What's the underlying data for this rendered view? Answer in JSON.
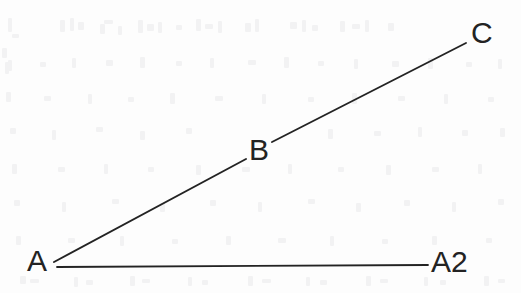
{
  "figure": {
    "background_color": "#fdfdfd",
    "stroke_color": "#232323",
    "labels": {
      "a": "A",
      "b": "B",
      "c": "C",
      "a2": "A2"
    },
    "label_positions": {
      "a": {
        "x": 37,
        "y": 260
      },
      "b": {
        "x": 257,
        "y": 150
      },
      "c": {
        "x": 481,
        "y": 32
      },
      "a2": {
        "x": 457,
        "y": 261
      }
    },
    "segments": [
      {
        "name": "ray-A-to-A2-horizontal",
        "from_label": "A",
        "to_label": "A2",
        "x1": 57,
        "y1": 267,
        "x2": 428,
        "y2": 265,
        "stroke_width": 1.8
      },
      {
        "name": "ray-A-to-B-diagonal",
        "from_label": "A",
        "to_label": "B",
        "x1": 54,
        "y1": 262,
        "x2": 246,
        "y2": 159,
        "stroke_width": 1.9
      },
      {
        "name": "ray-B-to-C-diagonal",
        "from_label": "B",
        "to_label": "C",
        "x1": 272,
        "y1": 142,
        "x2": 466,
        "y2": 43,
        "stroke_width": 1.9
      }
    ],
    "ghost_marks": [
      {
        "x": 8,
        "y": 18,
        "w": 4,
        "h": 14
      },
      {
        "x": 12,
        "y": 34,
        "w": 7,
        "h": 4
      },
      {
        "x": 2,
        "y": 48,
        "w": 5,
        "h": 10
      },
      {
        "x": 5,
        "y": 62,
        "w": 4,
        "h": 12
      },
      {
        "x": 60,
        "y": 20,
        "w": 5,
        "h": 12
      },
      {
        "x": 70,
        "y": 18,
        "w": 4,
        "h": 13
      },
      {
        "x": 78,
        "y": 22,
        "w": 6,
        "h": 8
      },
      {
        "x": 100,
        "y": 24,
        "w": 5,
        "h": 10
      },
      {
        "x": 104,
        "y": 20,
        "w": 9,
        "h": 4
      },
      {
        "x": 118,
        "y": 26,
        "w": 4,
        "h": 9
      },
      {
        "x": 138,
        "y": 20,
        "w": 5,
        "h": 13
      },
      {
        "x": 147,
        "y": 24,
        "w": 7,
        "h": 7
      },
      {
        "x": 158,
        "y": 22,
        "w": 4,
        "h": 11
      },
      {
        "x": 176,
        "y": 25,
        "w": 6,
        "h": 5
      },
      {
        "x": 196,
        "y": 19,
        "w": 5,
        "h": 12
      },
      {
        "x": 205,
        "y": 24,
        "w": 8,
        "h": 5
      },
      {
        "x": 218,
        "y": 21,
        "w": 4,
        "h": 12
      },
      {
        "x": 245,
        "y": 23,
        "w": 6,
        "h": 9
      },
      {
        "x": 255,
        "y": 19,
        "w": 4,
        "h": 13
      },
      {
        "x": 290,
        "y": 22,
        "w": 7,
        "h": 7
      },
      {
        "x": 302,
        "y": 20,
        "w": 4,
        "h": 12
      },
      {
        "x": 312,
        "y": 25,
        "w": 6,
        "h": 6
      },
      {
        "x": 340,
        "y": 21,
        "w": 5,
        "h": 11
      },
      {
        "x": 352,
        "y": 24,
        "w": 8,
        "h": 5
      },
      {
        "x": 365,
        "y": 20,
        "w": 4,
        "h": 12
      },
      {
        "x": 388,
        "y": 23,
        "w": 6,
        "h": 8
      },
      {
        "x": 8,
        "y": 60,
        "w": 4,
        "h": 11
      },
      {
        "x": 40,
        "y": 62,
        "w": 6,
        "h": 5
      },
      {
        "x": 72,
        "y": 58,
        "w": 4,
        "h": 10
      },
      {
        "x": 106,
        "y": 60,
        "w": 7,
        "h": 6
      },
      {
        "x": 140,
        "y": 57,
        "w": 5,
        "h": 11
      },
      {
        "x": 176,
        "y": 61,
        "w": 6,
        "h": 5
      },
      {
        "x": 210,
        "y": 58,
        "w": 4,
        "h": 10
      },
      {
        "x": 248,
        "y": 60,
        "w": 8,
        "h": 5
      },
      {
        "x": 284,
        "y": 57,
        "w": 5,
        "h": 11
      },
      {
        "x": 318,
        "y": 61,
        "w": 6,
        "h": 5
      },
      {
        "x": 354,
        "y": 59,
        "w": 4,
        "h": 10
      },
      {
        "x": 392,
        "y": 61,
        "w": 7,
        "h": 6
      },
      {
        "x": 428,
        "y": 58,
        "w": 5,
        "h": 11
      },
      {
        "x": 466,
        "y": 62,
        "w": 6,
        "h": 5
      },
      {
        "x": 498,
        "y": 59,
        "w": 4,
        "h": 10
      },
      {
        "x": 6,
        "y": 92,
        "w": 5,
        "h": 10
      },
      {
        "x": 44,
        "y": 96,
        "w": 7,
        "h": 5
      },
      {
        "x": 88,
        "y": 94,
        "w": 4,
        "h": 10
      },
      {
        "x": 128,
        "y": 97,
        "w": 6,
        "h": 5
      },
      {
        "x": 170,
        "y": 93,
        "w": 5,
        "h": 11
      },
      {
        "x": 215,
        "y": 96,
        "w": 8,
        "h": 5
      },
      {
        "x": 262,
        "y": 94,
        "w": 4,
        "h": 10
      },
      {
        "x": 308,
        "y": 97,
        "w": 6,
        "h": 5
      },
      {
        "x": 352,
        "y": 93,
        "w": 5,
        "h": 11
      },
      {
        "x": 398,
        "y": 96,
        "w": 7,
        "h": 5
      },
      {
        "x": 444,
        "y": 94,
        "w": 4,
        "h": 10
      },
      {
        "x": 488,
        "y": 97,
        "w": 6,
        "h": 5
      },
      {
        "x": 10,
        "y": 128,
        "w": 6,
        "h": 6
      },
      {
        "x": 52,
        "y": 130,
        "w": 4,
        "h": 10
      },
      {
        "x": 96,
        "y": 127,
        "w": 7,
        "h": 5
      },
      {
        "x": 140,
        "y": 131,
        "w": 5,
        "h": 9
      },
      {
        "x": 186,
        "y": 128,
        "w": 6,
        "h": 6
      },
      {
        "x": 328,
        "y": 129,
        "w": 5,
        "h": 10
      },
      {
        "x": 374,
        "y": 131,
        "w": 7,
        "h": 5
      },
      {
        "x": 418,
        "y": 127,
        "w": 4,
        "h": 10
      },
      {
        "x": 462,
        "y": 130,
        "w": 6,
        "h": 6
      },
      {
        "x": 500,
        "y": 128,
        "w": 5,
        "h": 9
      },
      {
        "x": 12,
        "y": 164,
        "w": 5,
        "h": 10
      },
      {
        "x": 58,
        "y": 167,
        "w": 7,
        "h": 5
      },
      {
        "x": 104,
        "y": 164,
        "w": 4,
        "h": 10
      },
      {
        "x": 148,
        "y": 167,
        "w": 6,
        "h": 5
      },
      {
        "x": 196,
        "y": 165,
        "w": 5,
        "h": 10
      },
      {
        "x": 242,
        "y": 167,
        "w": 8,
        "h": 5
      },
      {
        "x": 288,
        "y": 164,
        "w": 4,
        "h": 10
      },
      {
        "x": 338,
        "y": 167,
        "w": 6,
        "h": 5
      },
      {
        "x": 386,
        "y": 165,
        "w": 5,
        "h": 10
      },
      {
        "x": 432,
        "y": 167,
        "w": 7,
        "h": 5
      },
      {
        "x": 478,
        "y": 164,
        "w": 4,
        "h": 10
      },
      {
        "x": 14,
        "y": 200,
        "w": 6,
        "h": 6
      },
      {
        "x": 62,
        "y": 202,
        "w": 4,
        "h": 10
      },
      {
        "x": 112,
        "y": 199,
        "w": 7,
        "h": 5
      },
      {
        "x": 160,
        "y": 203,
        "w": 5,
        "h": 9
      },
      {
        "x": 210,
        "y": 200,
        "w": 6,
        "h": 6
      },
      {
        "x": 258,
        "y": 202,
        "w": 4,
        "h": 10
      },
      {
        "x": 308,
        "y": 199,
        "w": 7,
        "h": 5
      },
      {
        "x": 356,
        "y": 203,
        "w": 5,
        "h": 9
      },
      {
        "x": 404,
        "y": 200,
        "w": 6,
        "h": 6
      },
      {
        "x": 452,
        "y": 202,
        "w": 4,
        "h": 10
      },
      {
        "x": 498,
        "y": 199,
        "w": 6,
        "h": 6
      },
      {
        "x": 16,
        "y": 236,
        "w": 5,
        "h": 9
      },
      {
        "x": 68,
        "y": 238,
        "w": 7,
        "h": 5
      },
      {
        "x": 120,
        "y": 236,
        "w": 4,
        "h": 10
      },
      {
        "x": 172,
        "y": 239,
        "w": 6,
        "h": 5
      },
      {
        "x": 226,
        "y": 236,
        "w": 5,
        "h": 9
      },
      {
        "x": 278,
        "y": 238,
        "w": 8,
        "h": 5
      },
      {
        "x": 330,
        "y": 236,
        "w": 4,
        "h": 10
      },
      {
        "x": 382,
        "y": 239,
        "w": 6,
        "h": 5
      },
      {
        "x": 432,
        "y": 236,
        "w": 5,
        "h": 9
      },
      {
        "x": 486,
        "y": 238,
        "w": 6,
        "h": 5
      },
      {
        "x": 20,
        "y": 276,
        "w": 6,
        "h": 8
      },
      {
        "x": 30,
        "y": 279,
        "w": 9,
        "h": 4
      },
      {
        "x": 74,
        "y": 277,
        "w": 4,
        "h": 10
      },
      {
        "x": 86,
        "y": 280,
        "w": 7,
        "h": 5
      },
      {
        "x": 130,
        "y": 276,
        "w": 5,
        "h": 10
      },
      {
        "x": 142,
        "y": 279,
        "w": 8,
        "h": 4
      },
      {
        "x": 188,
        "y": 277,
        "w": 4,
        "h": 9
      },
      {
        "x": 202,
        "y": 280,
        "w": 6,
        "h": 5
      },
      {
        "x": 248,
        "y": 276,
        "w": 5,
        "h": 10
      },
      {
        "x": 262,
        "y": 279,
        "w": 9,
        "h": 4
      },
      {
        "x": 306,
        "y": 277,
        "w": 4,
        "h": 9
      },
      {
        "x": 320,
        "y": 280,
        "w": 7,
        "h": 5
      },
      {
        "x": 366,
        "y": 276,
        "w": 5,
        "h": 10
      },
      {
        "x": 380,
        "y": 279,
        "w": 8,
        "h": 4
      },
      {
        "x": 424,
        "y": 277,
        "w": 4,
        "h": 9
      },
      {
        "x": 440,
        "y": 280,
        "w": 6,
        "h": 5
      },
      {
        "x": 484,
        "y": 276,
        "w": 5,
        "h": 10
      },
      {
        "x": 498,
        "y": 279,
        "w": 7,
        "h": 4
      }
    ]
  }
}
